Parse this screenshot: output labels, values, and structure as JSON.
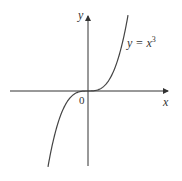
{
  "chart_data": {
    "type": "line",
    "title": "",
    "xlabel": "x",
    "ylabel": "y",
    "origin_label": "0",
    "series": [
      {
        "name": "y = x^3",
        "label_base": "y = x",
        "label_exp": "3",
        "x": [
          -1.6,
          -1.4,
          -1.2,
          -1.0,
          -0.8,
          -0.6,
          -0.4,
          -0.2,
          0,
          0.2,
          0.4,
          0.6,
          0.8,
          1.0,
          1.2,
          1.4,
          1.6
        ],
        "values": [
          -4.096,
          -2.744,
          -1.728,
          -1.0,
          -0.512,
          -0.216,
          -0.064,
          -0.008,
          0,
          0.008,
          0.064,
          0.216,
          0.512,
          1.0,
          1.728,
          2.744,
          4.096
        ]
      }
    ],
    "grid": false,
    "legend": "none",
    "annotations": [
      "y = x^3 label near upper right of curve"
    ],
    "colors": {
      "axis": "#333333",
      "curve": "#444444"
    }
  }
}
